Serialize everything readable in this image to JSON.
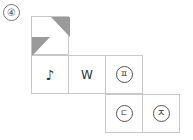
{
  "problem": {
    "number_label": "④"
  },
  "net": {
    "cells": [
      {
        "id": "top",
        "row": 0,
        "col": 0,
        "content": "",
        "shaded_triangles": [
          "top-right",
          "bottom-left"
        ]
      },
      {
        "id": "note",
        "row": 1,
        "col": 0,
        "content": "♪"
      },
      {
        "id": "w",
        "row": 1,
        "col": 1,
        "content": "W"
      },
      {
        "id": "pieup",
        "row": 1,
        "col": 2,
        "content": "ㅍ"
      },
      {
        "id": "digeut",
        "row": 2,
        "col": 2,
        "content": "ㄷ"
      },
      {
        "id": "jieut",
        "row": 2,
        "col": 3,
        "content": "ㅈ"
      }
    ],
    "shade_color": "#9a9a9a",
    "line_color": "#c8c8c8"
  }
}
